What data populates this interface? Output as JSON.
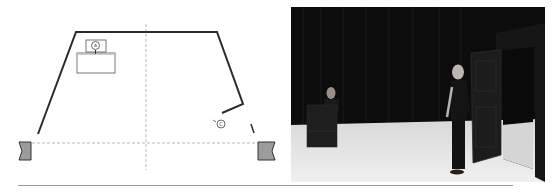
{
  "figure": {
    "left_panel": {
      "type": "stage-plan",
      "markers": [
        {
          "id": "actor-at-table",
          "label": "A"
        },
        {
          "id": "actor-near-door",
          "label": "C"
        }
      ]
    },
    "right_panel": {
      "type": "stage-photo"
    }
  },
  "colors": {
    "line": "#2b2b2b",
    "dash": "#a0a0a0",
    "wing": "#9c9c9c",
    "curtain": "#0c0c0c",
    "floor": "#e6e6e6"
  }
}
